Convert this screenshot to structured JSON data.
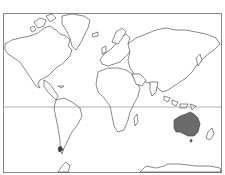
{
  "map": {
    "title": "",
    "projection": "mercator",
    "highlighted_region": "Australia",
    "colors": {
      "land_fill": "#ffffff",
      "coastline": "#3a3a3a",
      "highlight_fill": "#6b6b6b",
      "frame": "#8a8a8a",
      "equator": "#7a7a7a",
      "background": "#ffffff"
    },
    "lines": {
      "equator_y": 107
    }
  }
}
